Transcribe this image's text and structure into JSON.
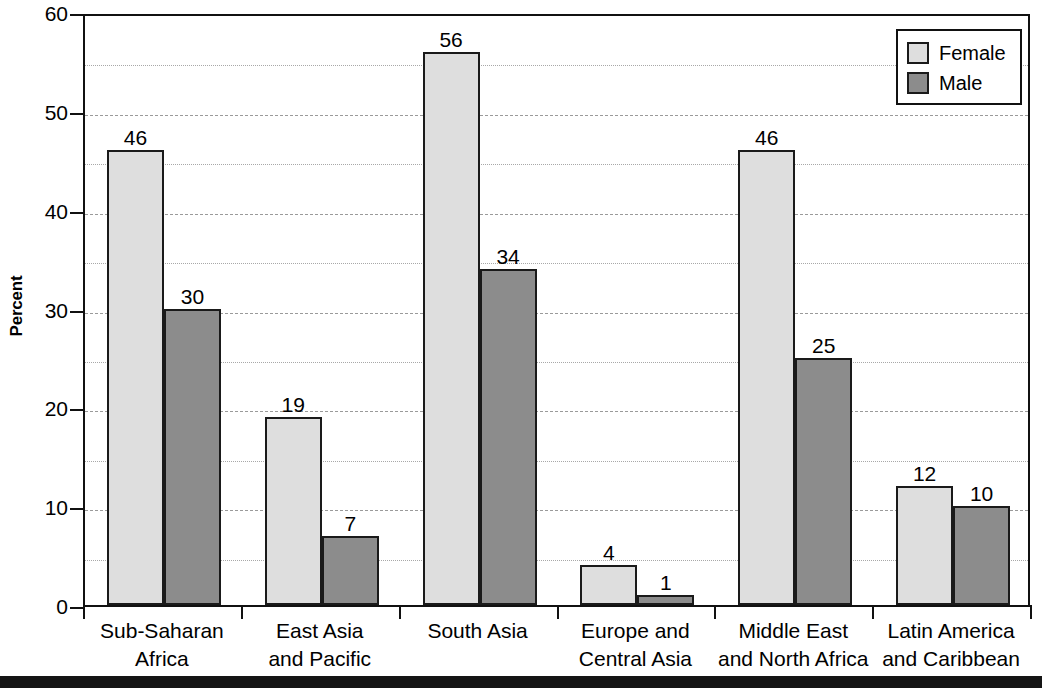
{
  "chart_data": {
    "type": "bar",
    "title": "",
    "xlabel": "",
    "ylabel": "Percent",
    "ylim": [
      0,
      60
    ],
    "y_ticks": [
      60,
      50,
      40,
      30,
      20,
      10,
      0
    ],
    "y_minor_ticks": [
      55,
      45,
      35,
      25,
      15,
      5
    ],
    "grid": true,
    "legend_position": "top-right",
    "categories": [
      "Sub-Saharan Africa",
      "East Asia and Pacific",
      "South Asia",
      "Europe and Central Asia",
      "Middle East and North Africa",
      "Latin America and Caribbean"
    ],
    "category_lines": [
      [
        "Sub-Saharan",
        "Africa"
      ],
      [
        "East Asia",
        "and Pacific"
      ],
      [
        "South Asia",
        ""
      ],
      [
        "Europe and",
        "Central Asia"
      ],
      [
        "Middle East",
        "and North Africa"
      ],
      [
        "Latin America",
        "and Caribbean"
      ]
    ],
    "series": [
      {
        "name": "Female",
        "color": "#dedede",
        "values": [
          46,
          19,
          56,
          4,
          46,
          12
        ]
      },
      {
        "name": "Male",
        "color": "#8c8c8c",
        "values": [
          30,
          7,
          34,
          1,
          25,
          10
        ]
      }
    ]
  },
  "axis": {
    "y_title": "Percent",
    "y_tick_labels": [
      "60",
      "50",
      "40",
      "30",
      "20",
      "10",
      "0"
    ]
  },
  "legend": {
    "items": [
      {
        "label": "Female",
        "swatch": "female-swatch"
      },
      {
        "label": "Male",
        "swatch": "male-swatch"
      }
    ]
  },
  "colors": {
    "female_fill": "#dedede",
    "male_fill": "#8c8c8c",
    "bar_outline": "#1a1a1a",
    "frame": "#111111",
    "gridline": "#9a9a9a",
    "background": "#ffffff"
  }
}
